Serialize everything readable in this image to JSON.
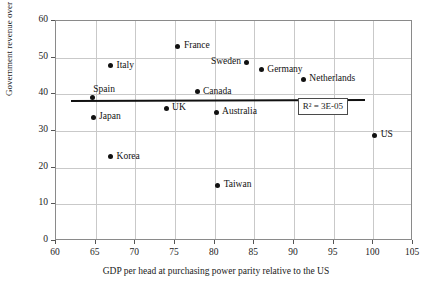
{
  "chart_data": {
    "type": "scatter",
    "title": "",
    "xlabel": "GDP per head at purchasing power parity relative to the US",
    "ylabel": "Government revenue over GDP",
    "xlim": [
      60,
      105
    ],
    "ylim": [
      0,
      60
    ],
    "xticks": [
      60,
      65,
      70,
      75,
      80,
      85,
      90,
      95,
      100,
      105
    ],
    "yticks": [
      0,
      10,
      20,
      30,
      40,
      50,
      60
    ],
    "grid": true,
    "legend": "none",
    "annotations": [
      {
        "text": "R² = 3E-05",
        "x": 94.0,
        "y": 36.5
      }
    ],
    "trendline": {
      "x0": 62.0,
      "y0": 38.2,
      "x1": 99.0,
      "y1": 38.5
    },
    "points": [
      {
        "label": "Spain",
        "x": 64.7,
        "y": 38.8,
        "label_pos": "above-right"
      },
      {
        "label": "Japan",
        "x": 64.8,
        "y": 33.5,
        "label_pos": "right"
      },
      {
        "label": "Italy",
        "x": 67.0,
        "y": 47.5,
        "label_pos": "right"
      },
      {
        "label": "Korea",
        "x": 67.0,
        "y": 22.7,
        "label_pos": "right"
      },
      {
        "label": "UK",
        "x": 74.0,
        "y": 36.0,
        "label_pos": "right"
      },
      {
        "label": "France",
        "x": 75.5,
        "y": 52.8,
        "label_pos": "right"
      },
      {
        "label": "Canada",
        "x": 77.9,
        "y": 40.5,
        "label_pos": "right"
      },
      {
        "label": "Australia",
        "x": 80.3,
        "y": 34.8,
        "label_pos": "right"
      },
      {
        "label": "Taiwan",
        "x": 80.5,
        "y": 15.0,
        "label_pos": "right"
      },
      {
        "label": "Sweden",
        "x": 84.2,
        "y": 48.5,
        "label_pos": "left"
      },
      {
        "label": "Germany",
        "x": 86.0,
        "y": 46.5,
        "label_pos": "right"
      },
      {
        "label": "Netherlands",
        "x": 91.3,
        "y": 43.9,
        "label_pos": "right"
      },
      {
        "label": "US",
        "x": 100.3,
        "y": 28.6,
        "label_pos": "right"
      }
    ]
  },
  "colors": {
    "point": "#111111",
    "trendline": "#111111",
    "grid": "#c9c9c9",
    "frame": "#8a8a8a",
    "text": "#1a1a1a",
    "background": "#ffffff"
  }
}
